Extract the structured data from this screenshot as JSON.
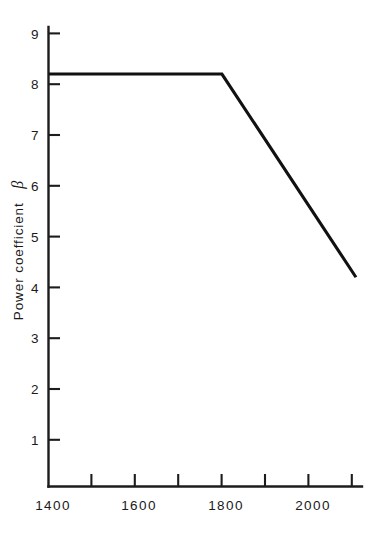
{
  "chart_data": {
    "type": "line",
    "title": "",
    "subtitle": "",
    "xlabel": "",
    "ylabel": "Power coefficient β",
    "ylabel_text": "Power coefficient",
    "ylabel_symbol": "β",
    "x": [
      1400,
      1800,
      2110
    ],
    "y": [
      8.2,
      8.2,
      4.2
    ],
    "series": [
      {
        "name": "Power coefficient",
        "x": [
          1400,
          1800,
          2110
        ],
        "values": [
          8.2,
          8.2,
          4.2
        ]
      }
    ],
    "xlim": [
      1400,
      2110
    ],
    "ylim": [
      0.0,
      9.35
    ],
    "x_tick_labels": [
      "1400",
      "1600",
      "1800",
      "2000"
    ],
    "x_tick_values": [
      1400,
      1600,
      1800,
      2000
    ],
    "x_minor_ticks": [
      1500,
      1600,
      1700,
      1800,
      1900,
      2000,
      2100
    ],
    "x_tick_interval": 100,
    "y_tick_labels": [
      "9",
      "8",
      "7",
      "6",
      "5",
      "4",
      "3",
      "2",
      "1"
    ],
    "y_tick_values": [
      9,
      8,
      7,
      6,
      5,
      4,
      3,
      2,
      1
    ],
    "grid": false,
    "legend": false,
    "legend_position": "none",
    "annotations": [],
    "line_color": "#111111",
    "axis_color": "#1c1c1c",
    "background_color": "#ffffff",
    "breakpoint_x": 1800,
    "breakpoint_y": 8.2,
    "plateau_value": 8.2,
    "end_value": 4.2
  }
}
